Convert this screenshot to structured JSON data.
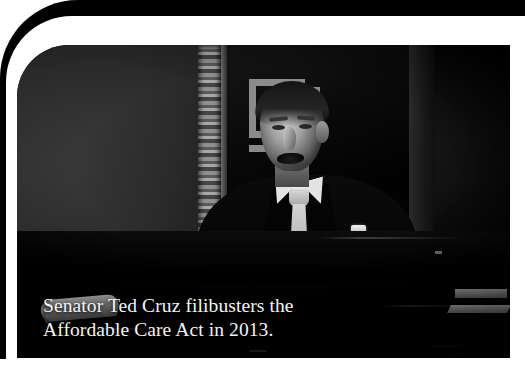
{
  "figure": {
    "caption": {
      "line1": "Senator Ted Cruz filibusters the",
      "line2": "Affordable Care Act in 2013.",
      "full_text": "Senator Ted Cruz filibusters the Affordable Care Act in 2013."
    },
    "photo": {
      "description": "Dark, low-key black-and-white photograph of a man in a dark suit, white dress shirt and light grey necktie speaking from behind a Senate desk. An ornate egg-and-dart pilaster and a Greek-key (meander) fret ornament are visible on the wall behind him, and papers rest on the desks to either side.",
      "treatment": "black-and-white",
      "subject": "Senator Ted Cruz",
      "setting": "United States Senate chamber"
    },
    "frame": {
      "style": "rounded-top-left-corner",
      "outer_color": "#000000",
      "band_color": "#ffffff",
      "page_background": "#ffffff"
    },
    "colors": {
      "caption_text": "#f4f4f4",
      "photo_shadow": "#050505",
      "tie_highlight": "#cecece",
      "shirt_highlight": "#e6e6e6",
      "stone_wall": "#4a4a4a",
      "fret_ornament": "#8a8a8a"
    }
  }
}
